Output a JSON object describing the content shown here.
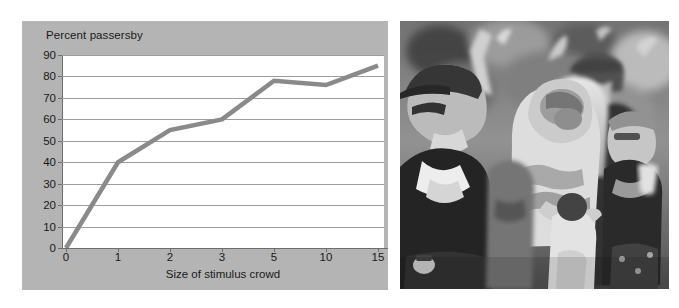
{
  "figure": {
    "panel_bg": "#b4b4b4",
    "plot_bg": "#ffffff",
    "series_color": "#8a8a8a",
    "grid_color": "#9d9d9d",
    "axis_color": "#6d6d6d",
    "text_color": "#1a1a1a"
  },
  "chart_data": {
    "type": "line",
    "title": "",
    "ylabel": "Percent passersby",
    "xlabel": "Size of stimulus crowd",
    "categories": [
      "0",
      "1",
      "2",
      "3",
      "5",
      "10",
      "15"
    ],
    "x": [
      0,
      1,
      2,
      3,
      5,
      10,
      15
    ],
    "values": [
      0,
      40,
      55,
      60,
      78,
      76,
      85
    ],
    "series": [
      {
        "name": "Percent passersby",
        "values": [
          0,
          40,
          55,
          60,
          78,
          76,
          85
        ]
      }
    ],
    "yticks": [
      0,
      10,
      20,
      30,
      40,
      50,
      60,
      70,
      80,
      90
    ],
    "ylim": [
      0,
      90
    ],
    "grid": "horizontal",
    "legend": "none",
    "xscale": "ordinal"
  },
  "photo": {
    "caption": "",
    "alt": "black-and-white photograph of a crowd of people standing outdoors looking upward",
    "people": [
      "man in dark vest and sunglasses looking up",
      "person with raised arm",
      "woman with blonde hair holding a child",
      "man wearing a baseball cap",
      "woman in dark top with sunglasses on head",
      "child in light shirt"
    ]
  }
}
